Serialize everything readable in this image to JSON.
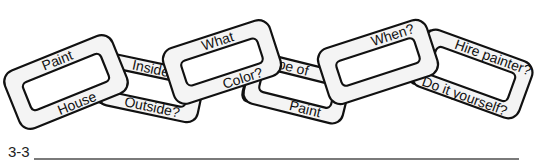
{
  "diagram": {
    "links": [
      {
        "top": "Paint",
        "bottom": "House"
      },
      {
        "top": "Inside or",
        "bottom": "Outside?"
      },
      {
        "top": "What",
        "bottom": "Color?"
      },
      {
        "top": "Type of",
        "bottom": "Paint"
      },
      {
        "top": "When?",
        "bottom": ""
      },
      {
        "top": "Hire painter?",
        "bottom": "Do it yourself?"
      }
    ]
  },
  "figure": {
    "label": "3-3"
  }
}
